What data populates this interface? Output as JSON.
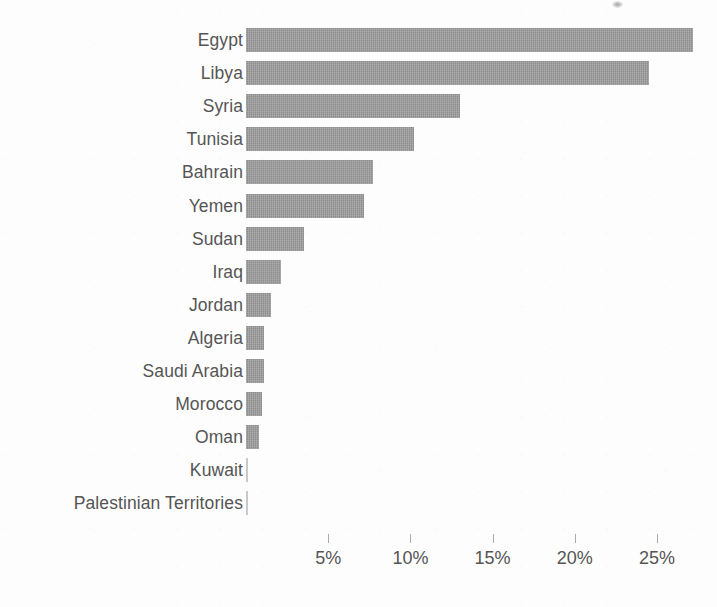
{
  "chart_data": {
    "type": "bar",
    "orientation": "horizontal",
    "title": "",
    "subtitle": "",
    "xlabel": "",
    "ylabel": "",
    "grid": false,
    "legend": "none",
    "xlim": [
      0,
      28.4
    ],
    "xticks": [
      5,
      10,
      15,
      20,
      25
    ],
    "xtick_labels": [
      "5%",
      "10%",
      "15%",
      "20%",
      "25%"
    ],
    "value_suffix": "%",
    "bar_color": "#9b9b9b",
    "label_color": "#555555",
    "categories": [
      "Egypt",
      "Libya",
      "Syria",
      "Tunisia",
      "Bahrain",
      "Yemen",
      "Sudan",
      "Iraq",
      "Jordan",
      "Algeria",
      "Saudi Arabia",
      "Morocco",
      "Oman",
      "Kuwait",
      "Palestinian Territories"
    ],
    "values": [
      27.2,
      24.5,
      13.0,
      10.2,
      7.7,
      7.2,
      3.5,
      2.1,
      1.5,
      1.1,
      1.1,
      1.0,
      0.8,
      0.05,
      0.05
    ]
  }
}
